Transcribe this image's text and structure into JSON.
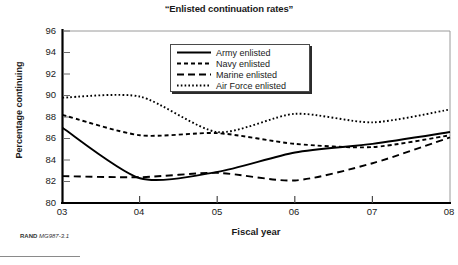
{
  "chart_data": {
    "type": "line",
    "title": "“Enlisted continuation rates”",
    "xlabel": "Fiscal year",
    "ylabel": "Percentage continuing",
    "x": [
      "03",
      "04",
      "05",
      "06",
      "07",
      "08"
    ],
    "xtick_labels": [
      "03",
      "04",
      "05",
      "06",
      "07",
      "08"
    ],
    "ytick_labels": [
      "96",
      "94",
      "92",
      "90",
      "88",
      "86",
      "84",
      "82",
      "80"
    ],
    "ylim": [
      80,
      96
    ],
    "ytick_step": 2,
    "grid": false,
    "legend_position": "top-center-inside",
    "series": [
      {
        "name": "Army enlisted",
        "legend_label": "Army enlisted",
        "style": "solid",
        "color": "#000000",
        "values": [
          87.0,
          82.3,
          82.9,
          84.7,
          85.5,
          86.6
        ]
      },
      {
        "name": "Navy enlisted",
        "legend_label": "Navy enlisted",
        "style": "fine-dashed",
        "color": "#000000",
        "values": [
          88.2,
          86.3,
          86.5,
          85.5,
          85.2,
          86.3
        ]
      },
      {
        "name": "Marine enlisted",
        "legend_label": "Marine enlisted",
        "style": "long-dashed",
        "color": "#000000",
        "values": [
          82.5,
          82.4,
          82.8,
          82.1,
          83.7,
          86.1
        ]
      },
      {
        "name": "Air Force enlisted",
        "legend_label": "Air Force enlisted",
        "style": "dotted",
        "color": "#000000",
        "values": [
          89.8,
          89.9,
          86.6,
          88.3,
          87.5,
          88.7
        ]
      }
    ]
  },
  "source_note": {
    "bold": "RAND",
    "italic": "MG987-3.1"
  }
}
